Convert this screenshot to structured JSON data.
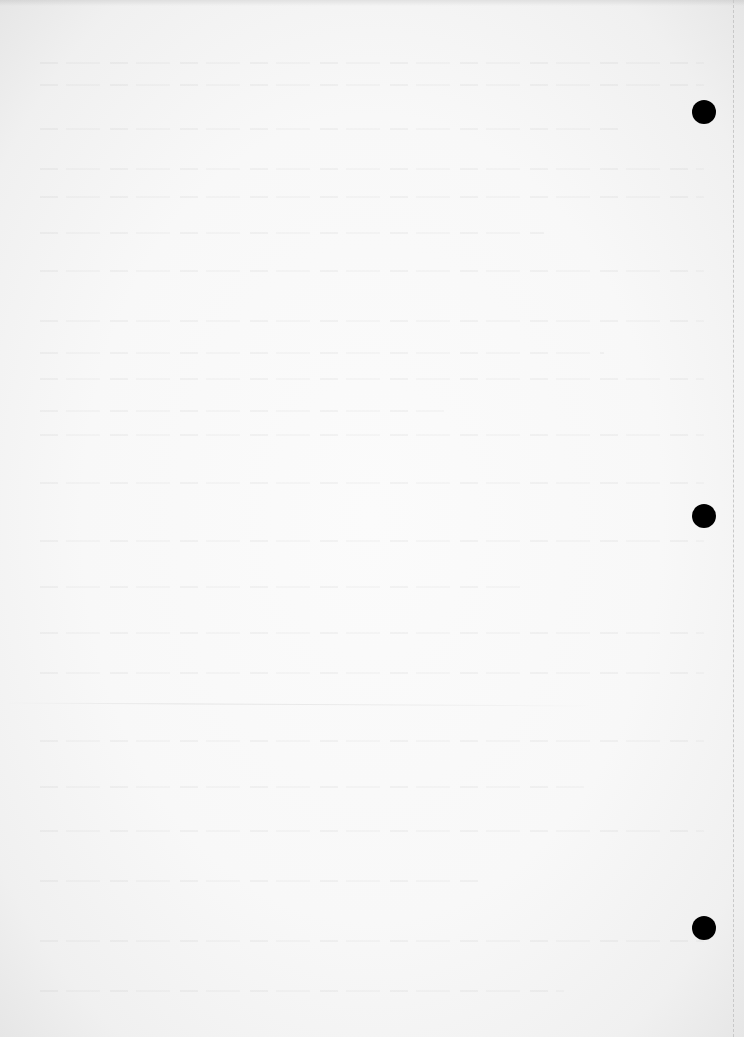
{
  "document": {
    "type": "scanned-blank-page",
    "text_content": "",
    "background_color": "#f8f8f8",
    "hole_color": "#000000",
    "punch_holes": [
      {
        "name": "top",
        "cx": 704,
        "cy": 112
      },
      {
        "name": "middle",
        "cx": 704,
        "cy": 516
      },
      {
        "name": "bottom",
        "cx": 704,
        "cy": 928
      }
    ],
    "edge_line_x": 733
  }
}
